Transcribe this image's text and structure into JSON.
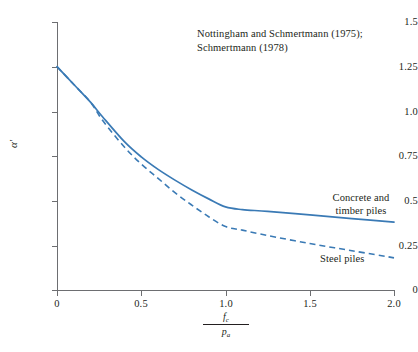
{
  "chart_data": {
    "type": "line",
    "title": "",
    "xlabel": "fc / pa",
    "xlabel_numerator": "f",
    "xlabel_numerator_sub": "c",
    "xlabel_denominator": "p",
    "xlabel_denominator_sub": "a",
    "ylabel": "α′",
    "xlim": [
      0,
      2.0
    ],
    "ylim": [
      0,
      1.5
    ],
    "xticks": [
      "0",
      "0.5",
      "1.0",
      "1.5",
      "2.0"
    ],
    "xtick_values": [
      0,
      0.5,
      1.0,
      1.5,
      2.0
    ],
    "yticks": [
      "0",
      "0.25",
      "0.5",
      "0.75",
      "1.0",
      "1.25",
      "1.5"
    ],
    "ytick_values": [
      0,
      0.25,
      0.5,
      0.75,
      1.0,
      1.25,
      1.5
    ],
    "grid": false,
    "legend_position": "inline-annotations",
    "line_color": "#3a7ab5",
    "axis_color": "#6d6e71",
    "annotations": [
      {
        "name": "source-citation",
        "line1": "Nottingham and Schmertmann (1975);",
        "line2": "Schmertmann (1978)"
      }
    ],
    "series": [
      {
        "name": "Concrete and timber piles",
        "style": "solid",
        "label_line1": "Concrete and",
        "label_line2": "timber piles",
        "x": [
          0.0,
          0.1,
          0.2,
          0.27,
          0.4,
          0.5,
          0.6,
          0.7,
          0.8,
          0.9,
          1.0,
          1.1,
          1.25,
          1.5,
          1.75,
          2.0
        ],
        "y": [
          1.25,
          1.15,
          1.05,
          0.97,
          0.83,
          0.745,
          0.675,
          0.615,
          0.56,
          0.51,
          0.465,
          0.45,
          0.44,
          0.42,
          0.4,
          0.38
        ]
      },
      {
        "name": "Steel piles",
        "style": "dashed",
        "label_line1": "Steel piles",
        "x": [
          0.0,
          0.1,
          0.2,
          0.27,
          0.4,
          0.5,
          0.6,
          0.7,
          0.8,
          0.9,
          1.0,
          1.1,
          1.25,
          1.5,
          1.75,
          2.0
        ],
        "y": [
          1.25,
          1.15,
          1.05,
          0.95,
          0.8,
          0.705,
          0.625,
          0.545,
          0.475,
          0.41,
          0.355,
          0.335,
          0.305,
          0.26,
          0.22,
          0.18
        ]
      }
    ]
  }
}
